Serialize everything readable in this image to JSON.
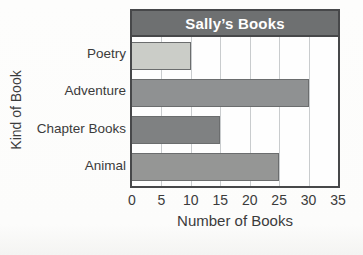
{
  "chart_data": {
    "type": "bar",
    "orientation": "horizontal",
    "title": "Sally’s Books",
    "xlabel": "Number of Books",
    "ylabel": "Kind of Book",
    "categories": [
      "Poetry",
      "Adventure",
      "Chapter Books",
      "Animal"
    ],
    "values": [
      10,
      30,
      15,
      25
    ],
    "xlim": [
      0,
      35
    ],
    "xticks": [
      0,
      5,
      10,
      15,
      20,
      25,
      30,
      35
    ],
    "grid": "vertical",
    "legend": "none",
    "bar_colors": [
      "#cbcdc8",
      "#8f9192",
      "#7f8182",
      "#959695"
    ],
    "bar_border_color": "#6b6d6e"
  },
  "colors": {
    "title_bar_bg": "#6e7071",
    "frame_border": "#47484a",
    "title_text": "#ffffff",
    "gridline": "#c9ccce",
    "plot_bg": "#fefefe",
    "page_bg": "#fdfdfc",
    "text": "#3b3b3b"
  }
}
